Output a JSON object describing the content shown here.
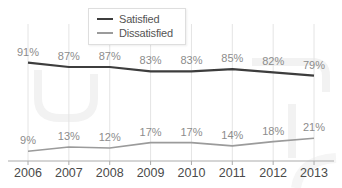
{
  "chart_data": {
    "type": "line",
    "title": "",
    "xlabel": "",
    "ylabel": "",
    "categories": [
      "2006",
      "2007",
      "2008",
      "2009",
      "2010",
      "2011",
      "2012",
      "2013"
    ],
    "series": [
      {
        "name": "Satisfied",
        "values": [
          91,
          87,
          87,
          83,
          83,
          85,
          82,
          79
        ],
        "color": "#3d3d3d"
      },
      {
        "name": "Dissatisfied",
        "values": [
          9,
          13,
          12,
          17,
          17,
          14,
          18,
          21
        ],
        "color": "#9b9b9b"
      }
    ],
    "value_suffix": "%",
    "ylim": [
      0,
      100
    ],
    "grid": "vertical",
    "data_labels": true,
    "legend_position": "top-center"
  },
  "palette": {
    "background": "#ffffff",
    "grid": "#e4e4e4",
    "axis": "#ababab",
    "data_label": "#8c8c8c",
    "year_label": "#4a4a4a",
    "watermark": "#f2f2f2"
  }
}
